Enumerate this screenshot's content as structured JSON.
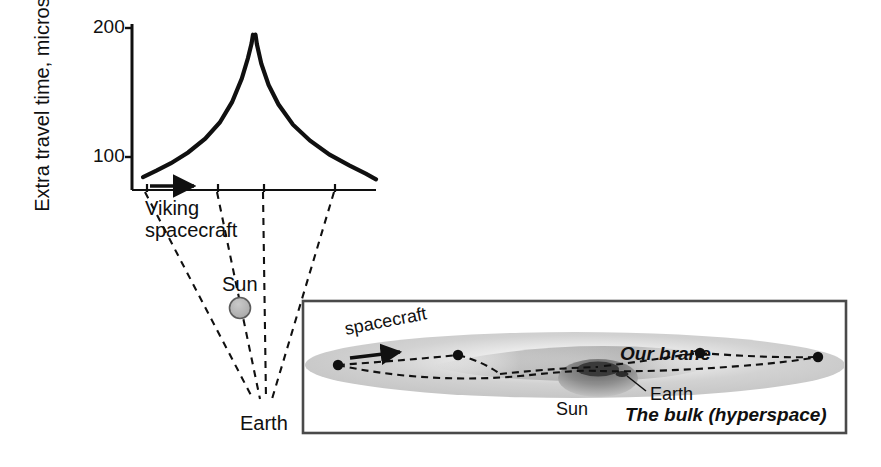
{
  "figure": {
    "background_color": "#ffffff",
    "ink_color": "#101010"
  },
  "chart_data": {
    "type": "line",
    "title": "",
    "xlabel": "",
    "ylabel": "Extra travel time, microseconds",
    "y_ticks": [
      100,
      200
    ],
    "y_tick_labels": [
      "100",
      "200"
    ],
    "ylim": [
      60,
      215
    ],
    "xlim": [
      0,
      10
    ],
    "grid": false,
    "legend": false,
    "x_axis_tick_positions": [
      1.0,
      4.2,
      6.2,
      9.4
    ],
    "annotations": [
      {
        "text": "Viking spacecraft",
        "x": 1.2,
        "y": 52
      },
      {
        "text": "Sun",
        "x": 4.9,
        "y": -70
      },
      {
        "text": "Earth",
        "x": 5.4,
        "y": -210
      }
    ],
    "series": [
      {
        "name": "Extra travel time (left branch)",
        "x": [
          0.45,
          1.0,
          1.6,
          2.3,
          3.0,
          3.6,
          4.1,
          4.5,
          4.75,
          4.9,
          4.96
        ],
        "y": [
          72,
          78,
          85,
          95,
          108,
          123,
          142,
          164,
          183,
          197,
          205
        ]
      },
      {
        "name": "Extra travel time (right branch)",
        "x": [
          5.06,
          5.12,
          5.3,
          5.6,
          6.0,
          6.6,
          7.3,
          8.1,
          8.9,
          9.6,
          10.0
        ],
        "y": [
          205,
          196,
          178,
          158,
          140,
          121,
          106,
          93,
          83,
          75,
          70
        ]
      }
    ]
  },
  "axis": {
    "y_title": "Extra travel time, microseconds",
    "y_tick_200": "200",
    "y_tick_100": "100"
  },
  "outer_diagram": {
    "viking_label_line1": "Viking",
    "viking_label_line2": "spacecraft",
    "sun_label": "Sun",
    "earth_label": "Earth",
    "sun_color": "#b3b3b3",
    "sightline_style": "dashed"
  },
  "inset": {
    "border_color": "#555555",
    "brane_color": "#c9c9c9",
    "spacecraft_label": "spacecraft",
    "our_brane_label": "Our brane",
    "earth_label": "Earth",
    "sun_label": "Sun",
    "bulk_label": "The bulk (hyperspace)",
    "node_count": 5
  }
}
